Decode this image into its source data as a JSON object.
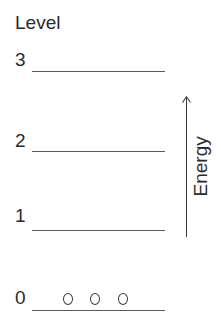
{
  "diagram": {
    "title": "Level",
    "levels": [
      {
        "label": "3",
        "particles": 0
      },
      {
        "label": "2",
        "particles": 0
      },
      {
        "label": "1",
        "particles": 0
      },
      {
        "label": "0",
        "particles": 3
      }
    ],
    "axis_label": "Energy",
    "axis_direction": "up",
    "particle_glyph": "o"
  }
}
